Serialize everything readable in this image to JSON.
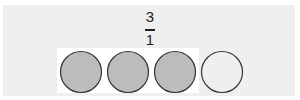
{
  "fraction": {
    "numerator": "3",
    "denominator": "1"
  },
  "circles": [
    {
      "shaded": true
    },
    {
      "shaded": true
    },
    {
      "shaded": true
    },
    {
      "shaded": false
    }
  ],
  "colors": {
    "shaded_fill": "#bcbcbc",
    "unshaded_fill": "#efefef",
    "stroke": "#333333",
    "background": "#efefef"
  }
}
